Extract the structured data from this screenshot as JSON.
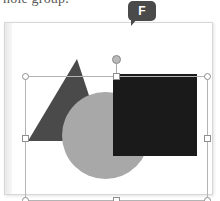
{
  "document": {
    "body_text_fragment": "hole group."
  },
  "shortcut_badge": {
    "key_label": "F",
    "icon": "speech-bubble-callout",
    "bubble_color": "#4a4a4a",
    "text_color": "#ffffff"
  },
  "canvas": {
    "background_color": "#ffffff",
    "border_color": "#d8d8d8",
    "gutter_color": "#ececec"
  },
  "selection": {
    "border_color": "#b4b4b4",
    "handle_fill": "#ffffff",
    "handle_border": "#8e8e8e",
    "rotation_handle_fill": "#b9b9b9",
    "handles": [
      {
        "name": "handle-top-left",
        "shape": "circle"
      },
      {
        "name": "handle-top-center",
        "shape": "square"
      },
      {
        "name": "handle-top-right",
        "shape": "circle"
      },
      {
        "name": "handle-middle-left",
        "shape": "square"
      },
      {
        "name": "handle-middle-right",
        "shape": "square"
      },
      {
        "name": "handle-bottom-left",
        "shape": "circle"
      },
      {
        "name": "handle-bottom-center",
        "shape": "square"
      },
      {
        "name": "handle-bottom-right",
        "shape": "circle"
      }
    ]
  },
  "shapes": [
    {
      "name": "triangle",
      "color": "#4a4a4a"
    },
    {
      "name": "circle",
      "color": "#a8a8a8"
    },
    {
      "name": "rectangle",
      "color": "#1a1a1a"
    }
  ],
  "colors": {
    "triangle": "#4a4a4a",
    "circle": "#a8a8a8",
    "rectangle": "#1a1a1a"
  }
}
